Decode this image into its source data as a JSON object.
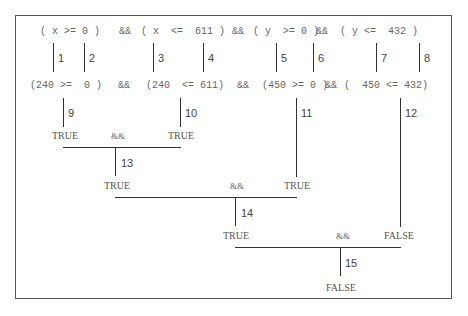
{
  "expression": {
    "row1": {
      "c1": "( x >= 0 )",
      "op1": "&&",
      "c2": "( x  <=  611 )",
      "op2": "&&",
      "c3": "( y  >= 0 )",
      "op3": "&&",
      "c4": "( y <=  432 )"
    },
    "row2": {
      "c1": "(240 >=  0 )",
      "op1": "&&",
      "c2": "(240  <= 611)",
      "op2": "&&",
      "c3": "(450 >= 0 )",
      "op3": "&&",
      "c4": "(  450 <= 432)"
    }
  },
  "step_labels": [
    "1",
    "2",
    "3",
    "4",
    "5",
    "6",
    "7",
    "8",
    "9",
    "10",
    "11",
    "12",
    "13",
    "14",
    "15"
  ],
  "level1": {
    "left": "TRUE",
    "op": "&&",
    "right": "TRUE"
  },
  "level2": {
    "left": "TRUE",
    "op": "&&",
    "right": "TRUE"
  },
  "level3": {
    "left": "TRUE",
    "op": "&&",
    "right": "FALSE"
  },
  "result": "FALSE",
  "colors": {
    "line": "#333333",
    "border": "#555555",
    "text": "#666666"
  }
}
